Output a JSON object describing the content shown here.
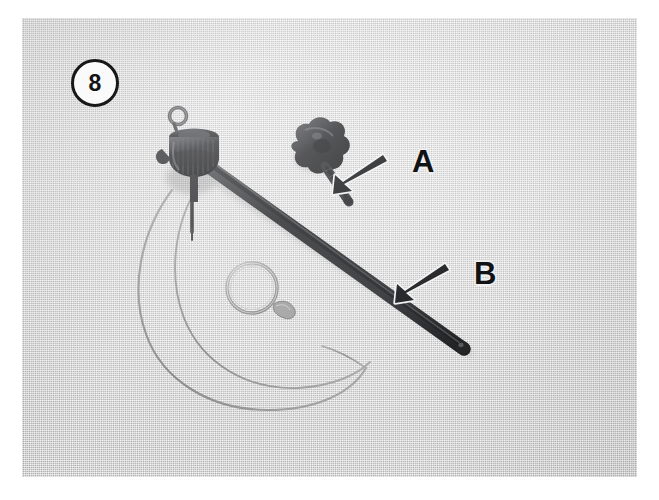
{
  "figure": {
    "number": "8",
    "kind": "halftone-photograph",
    "caption_labels": [
      "A",
      "B"
    ],
    "background_color": "#d4d4d4",
    "ink_color": "#1b1c1e",
    "paper_color": "#ffffff"
  },
  "badge": {
    "label": "8",
    "shape": "circle",
    "text_color": "#121315",
    "fill_color": "#fafafa",
    "border_color": "#17181a"
  },
  "callouts": [
    {
      "id": "callout-b",
      "letter": "B",
      "points_to": "thumbscrew-knob-part",
      "arrow_direction": "down-left",
      "letter_color": "#111215",
      "outline_color": "#eeeeee"
    },
    {
      "id": "callout-a",
      "letter": "A",
      "points_to": "extension-rod-shaft",
      "arrow_direction": "down-left",
      "letter_color": "#111215",
      "outline_color": "#eeeeee"
    }
  ],
  "parts": [
    {
      "id": "extension-rod-shaft",
      "name": "A",
      "description": "long dark diagonal rod",
      "color": "#26272a"
    },
    {
      "id": "thumbscrew-knob-part",
      "name": "B",
      "description": "small winged thumbscrew knob with threaded stem",
      "color": "#303134"
    },
    {
      "id": "hub-assembly",
      "name": "",
      "description": "dark cylindrical hub with small eyelet ring and downward pin",
      "color": "#2a2b2e"
    },
    {
      "id": "split-ring",
      "name": "",
      "description": "thin metal split ring on cable",
      "color": "#9a9a9a"
    },
    {
      "id": "cable-loop",
      "name": "",
      "description": "thin looped wire cable hanging below the hub",
      "color": "#8e8e8e"
    }
  ]
}
